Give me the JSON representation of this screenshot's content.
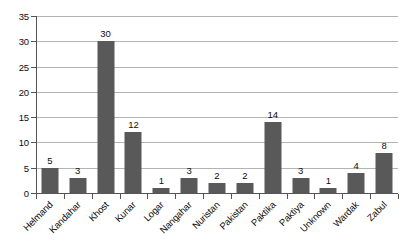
{
  "chart_data": {
    "type": "bar",
    "title": "",
    "subtitle": "",
    "xlabel": "",
    "ylabel": "",
    "categories": [
      "Helmand",
      "Kandahar",
      "Khost",
      "Kunar",
      "Logar",
      "Nangahar",
      "Nuristan",
      "Pakistan",
      "Paktika",
      "Paktiya",
      "Unknown",
      "Wardak",
      "Zabul"
    ],
    "values": [
      5,
      3,
      30,
      12,
      1,
      3,
      2,
      2,
      14,
      3,
      1,
      4,
      8
    ],
    "data_labels": [
      "5",
      "3",
      "30",
      "12",
      "1",
      "3",
      "2",
      "2",
      "14",
      "3",
      "1",
      "4",
      "8"
    ],
    "ylim": [
      0,
      35
    ],
    "ytick_step": 5,
    "ytick_labels": [
      "0",
      "5",
      "10",
      "15",
      "20",
      "25",
      "30",
      "35"
    ],
    "grid": true,
    "legend": false,
    "legend_position": "none",
    "bar_color": "#595959",
    "gridline_color": "#b4b4b4",
    "axis_color": "#555555",
    "background_color": "#ffffff",
    "label_rotation_deg": -45
  }
}
